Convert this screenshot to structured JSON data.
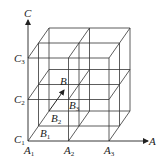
{
  "diagram": {
    "type": "3d-grid-lattice",
    "axes": {
      "A": {
        "label": "A",
        "ticks": [
          "A",
          "A",
          "A"
        ],
        "subs": [
          "1",
          "2",
          "3"
        ]
      },
      "B": {
        "label": "B",
        "ticks": [
          "B",
          "B",
          "B"
        ],
        "subs": [
          "1",
          "2",
          "3"
        ]
      },
      "C": {
        "label": "C",
        "ticks": [
          "C",
          "C",
          "C"
        ],
        "subs": [
          "1",
          "2",
          "3"
        ]
      }
    },
    "colors": {
      "line": "#333333",
      "text": "#222222",
      "background": "#ffffff"
    }
  }
}
